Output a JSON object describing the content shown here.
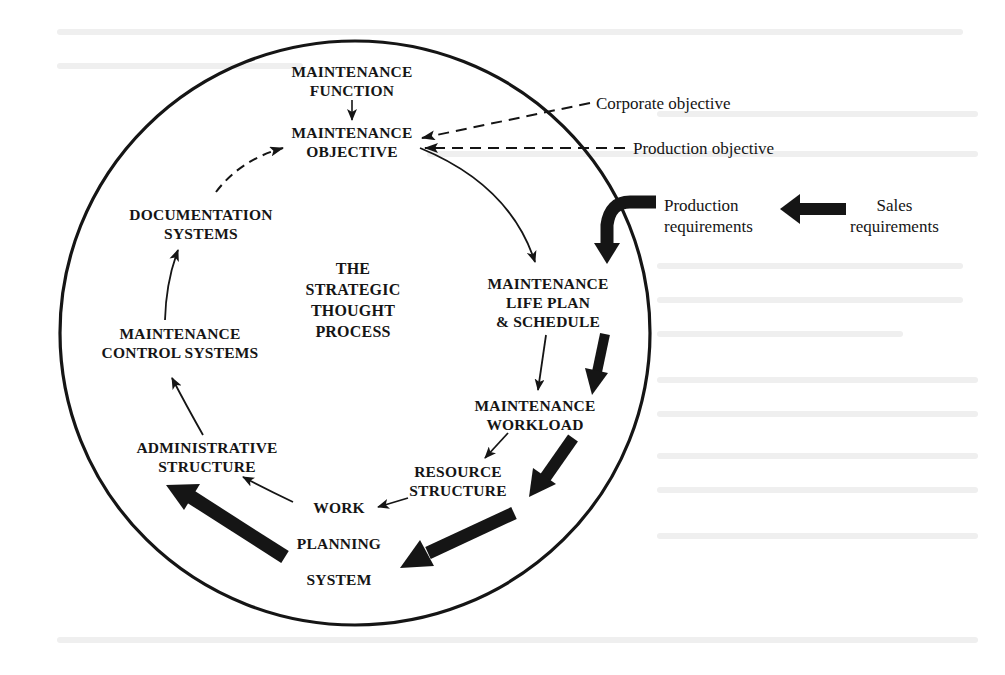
{
  "diagram": {
    "title": "THE STRATEGIC THOUGHT PROCESS",
    "center_label": [
      "THE",
      "STRATEGIC",
      "THOUGHT",
      "PROCESS"
    ],
    "nodes": {
      "maintenance_function": [
        "MAINTENANCE",
        "FUNCTION"
      ],
      "maintenance_objective": [
        "MAINTENANCE",
        "OBJECTIVE"
      ],
      "life_plan": [
        "MAINTENANCE",
        "LIFE PLAN",
        "& SCHEDULE"
      ],
      "workload": [
        "MAINTENANCE",
        "WORKLOAD"
      ],
      "resource_structure": [
        "RESOURCE",
        "STRUCTURE"
      ],
      "work_planning": [
        "WORK",
        "PLANNING",
        "SYSTEM"
      ],
      "administrative_structure": [
        "ADMINISTRATIVE",
        "STRUCTURE"
      ],
      "control_systems": [
        "MAINTENANCE",
        "CONTROL SYSTEMS"
      ],
      "documentation_systems": [
        "DOCUMENTATION",
        "SYSTEMS"
      ]
    },
    "external_inputs": {
      "corporate_objective": "Corporate objective",
      "production_objective": "Production objective",
      "production_requirements": [
        "Production",
        "requirements"
      ],
      "sales_requirements": [
        "Sales",
        "requirements"
      ]
    },
    "edges": [
      {
        "from": "MAINTENANCE FUNCTION",
        "to": "MAINTENANCE OBJECTIVE",
        "style": "thin"
      },
      {
        "from": "Corporate objective",
        "to": "MAINTENANCE OBJECTIVE",
        "style": "dashed"
      },
      {
        "from": "Production objective",
        "to": "MAINTENANCE OBJECTIVE",
        "style": "dashed"
      },
      {
        "from": "MAINTENANCE OBJECTIVE",
        "to": "MAINTENANCE LIFE PLAN & SCHEDULE",
        "style": "thin"
      },
      {
        "from": "Sales requirements",
        "to": "Production requirements",
        "style": "thick"
      },
      {
        "from": "Production requirements",
        "to": "MAINTENANCE LIFE PLAN & SCHEDULE",
        "style": "thick"
      },
      {
        "from": "MAINTENANCE LIFE PLAN & SCHEDULE",
        "to": "MAINTENANCE WORKLOAD",
        "style": "thin"
      },
      {
        "from": "MAINTENANCE LIFE PLAN & SCHEDULE",
        "to": "MAINTENANCE WORKLOAD",
        "style": "thick"
      },
      {
        "from": "MAINTENANCE WORKLOAD",
        "to": "RESOURCE STRUCTURE",
        "style": "thin"
      },
      {
        "from": "MAINTENANCE WORKLOAD",
        "to": "RESOURCE STRUCTURE",
        "style": "thick"
      },
      {
        "from": "RESOURCE STRUCTURE",
        "to": "WORK PLANNING SYSTEM",
        "style": "thin"
      },
      {
        "from": "RESOURCE STRUCTURE",
        "to": "WORK PLANNING SYSTEM",
        "style": "thick"
      },
      {
        "from": "WORK PLANNING SYSTEM",
        "to": "ADMINISTRATIVE STRUCTURE",
        "style": "thin"
      },
      {
        "from": "WORK PLANNING SYSTEM",
        "to": "ADMINISTRATIVE STRUCTURE",
        "style": "thick"
      },
      {
        "from": "ADMINISTRATIVE STRUCTURE",
        "to": "MAINTENANCE CONTROL SYSTEMS",
        "style": "thin"
      },
      {
        "from": "MAINTENANCE CONTROL SYSTEMS",
        "to": "DOCUMENTATION SYSTEMS",
        "style": "thin"
      },
      {
        "from": "DOCUMENTATION SYSTEMS",
        "to": "MAINTENANCE OBJECTIVE",
        "style": "dashed"
      }
    ],
    "colors": {
      "ink": "#151515",
      "background": "#ffffff",
      "show_through": "#ececec"
    }
  }
}
